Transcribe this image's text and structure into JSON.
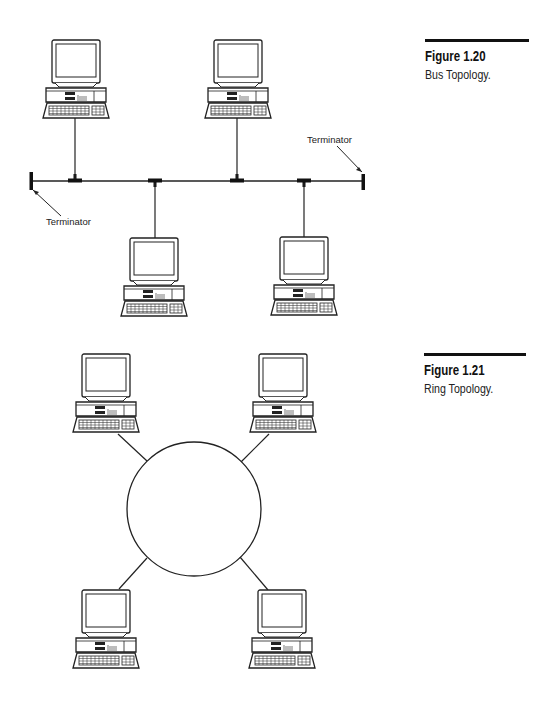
{
  "figures": [
    {
      "id": "fig-1-20",
      "number": "Figure 1.20",
      "caption": "Bus Topology.",
      "topology": "bus",
      "labels": {
        "terminator_left": "Terminator",
        "terminator_right": "Terminator"
      },
      "nodes": [
        {
          "name": "workstation-top-left",
          "position": "above-bus"
        },
        {
          "name": "workstation-top-right",
          "position": "above-bus"
        },
        {
          "name": "workstation-bottom-left",
          "position": "below-bus"
        },
        {
          "name": "workstation-bottom-right",
          "position": "below-bus"
        }
      ]
    },
    {
      "id": "fig-1-21",
      "number": "Figure 1.21",
      "caption": "Ring Topology.",
      "topology": "ring",
      "nodes": [
        {
          "name": "workstation-top-left"
        },
        {
          "name": "workstation-top-right"
        },
        {
          "name": "workstation-bottom-left"
        },
        {
          "name": "workstation-bottom-right"
        }
      ]
    }
  ],
  "colors": {
    "line": "#222222",
    "rule": "#111111",
    "background": "#ffffff"
  },
  "icons": {
    "workstation": "desktop-computer-icon",
    "terminator": "terminator-icon"
  }
}
